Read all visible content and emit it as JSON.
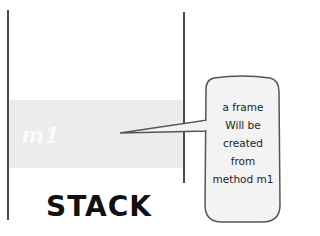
{
  "diagram": {
    "title": "STACK",
    "frame": {
      "label": "m1",
      "color": "#ececec"
    },
    "callout": {
      "lines": [
        "a frame",
        "Will be",
        "created",
        "from",
        "method m1"
      ]
    },
    "colors": {
      "wall": "#4a4a4a",
      "background": "#ffffff",
      "text": "#111111"
    }
  }
}
